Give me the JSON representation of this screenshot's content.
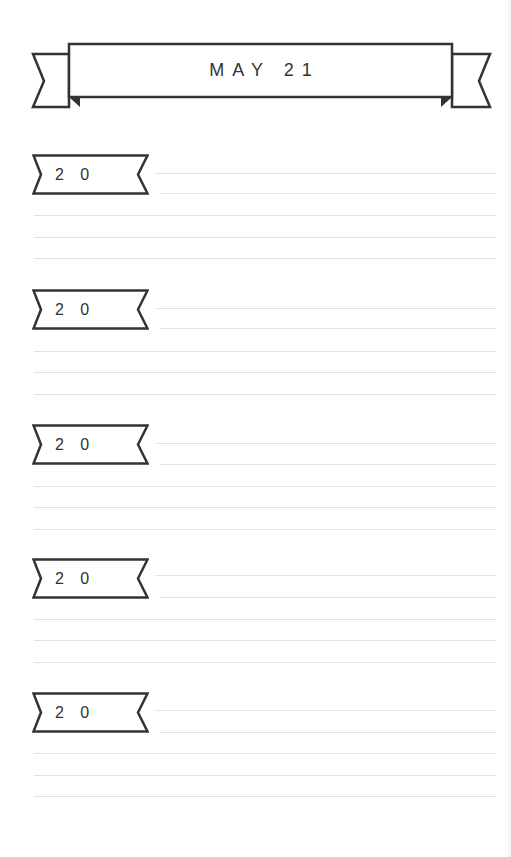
{
  "header": {
    "title": "MAY 21"
  },
  "entries": [
    {
      "year_label": "20",
      "year_display": "2 0"
    },
    {
      "year_label": "20",
      "year_display": "2 0"
    },
    {
      "year_label": "20",
      "year_display": "2 0"
    },
    {
      "year_label": "20",
      "year_display": "2 0"
    },
    {
      "year_label": "20",
      "year_display": "2 0"
    }
  ],
  "style": {
    "ink_color": "#333333",
    "rule_color": "#e2e2e2",
    "background": "#ffffff"
  }
}
